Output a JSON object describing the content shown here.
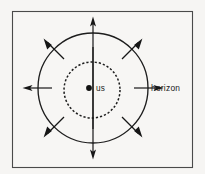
{
  "figure": {
    "background_color": "#f6f5f3",
    "frame_color": "#4a4a4a",
    "ink_color": "#161616"
  },
  "labels": {
    "observer": "us",
    "horizon": "horizon"
  },
  "geometry": {
    "frame": {
      "x": 12,
      "y": 11,
      "width": 181,
      "height": 157
    },
    "horizon_circle": {
      "cx": 93,
      "cy": 88,
      "r": 55
    },
    "inner_dashed_circle": {
      "cx": 92,
      "cy": 90,
      "r": 28
    },
    "observer_dot": {
      "cx": 89,
      "cy": 88,
      "r": 2.8
    },
    "observer_label_pos": {
      "x": 96,
      "y": 91
    },
    "horizon_label_pos": {
      "x": 151,
      "y": 91
    }
  },
  "arrows": {
    "count": 8,
    "description": "eight radial outward arrows crossing the horizon circle",
    "inner_radius": 41,
    "outer_radius": 70,
    "angles_deg": [
      270,
      315,
      0,
      45,
      90,
      135,
      180,
      225
    ],
    "directions": [
      "up",
      "up-right",
      "right",
      "down-right",
      "down",
      "down-left",
      "left",
      "up-left"
    ]
  }
}
